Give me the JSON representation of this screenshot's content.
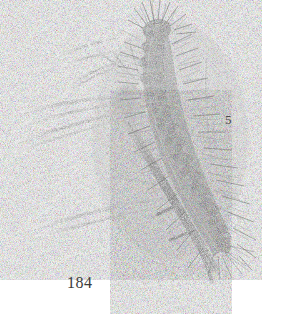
{
  "plate": {
    "background_color": "#ffffff",
    "width": 283,
    "height": 314,
    "medium": "grayscale stipple and line engraving",
    "figure_number": "5",
    "plate_number": "184",
    "subject": "hairy caterpillar (lepidopteran larva) resting on a pine twig with needle fascicles",
    "ink_colors": {
      "darkest": "#262626",
      "body_mid": "#555555",
      "needle_line": "#8a8a8a",
      "setae": "#6f6f6f",
      "label_text": "#3a3a3a"
    }
  },
  "illustration": {
    "title": "Caterpillar on pine shoot",
    "caterpillar": {
      "name": "caterpillar",
      "orientation": "diagonal, head upper-left, tail lower-right",
      "head_position": "top",
      "segment_count": 12,
      "features": [
        "segmented dorsal banding",
        "dark lateral blotches",
        "dense radiating setae tufts",
        "paler intersegmental rings"
      ]
    },
    "pine_twig": {
      "name": "pine-twig",
      "needle_count": 14,
      "direction": "needles fan toward the left and lower-left",
      "fascicle_position": "mid-left of the larva"
    }
  },
  "labels": {
    "figure_number": "5",
    "plate_number": "184"
  }
}
